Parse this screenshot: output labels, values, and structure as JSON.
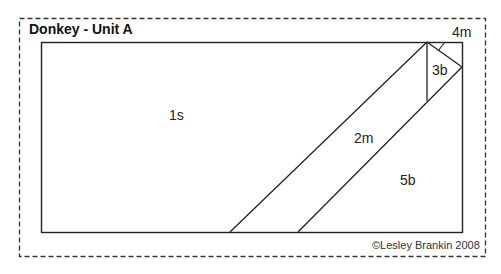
{
  "diagram": {
    "title": "Donkey - Unit A",
    "regions": [
      {
        "id": "1s",
        "label": "1s"
      },
      {
        "id": "2m",
        "label": "2m"
      },
      {
        "id": "3b",
        "label": "3b"
      },
      {
        "id": "4m",
        "label": "4m"
      },
      {
        "id": "5b",
        "label": "5b"
      }
    ],
    "copyright": "©Lesley Brankin 2008"
  }
}
